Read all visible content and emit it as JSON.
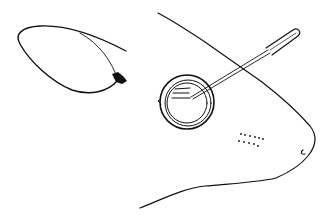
{
  "figure": {
    "description": "Line drawing of a mouse head in profile with a fine needle/pipette inserted toward the eye, and a separate loop of suture thread with a knot",
    "colors": {
      "line": "#111111",
      "background": "#ffffff"
    },
    "elements": [
      {
        "name": "suture-loop",
        "label": "suture loop with knot"
      },
      {
        "name": "mouse-head-outline",
        "label": "mouse head outline"
      },
      {
        "name": "eye",
        "label": "eye"
      },
      {
        "name": "needle",
        "label": "needle / pipette"
      },
      {
        "name": "whisker-pad",
        "label": "whisker dots"
      }
    ]
  }
}
